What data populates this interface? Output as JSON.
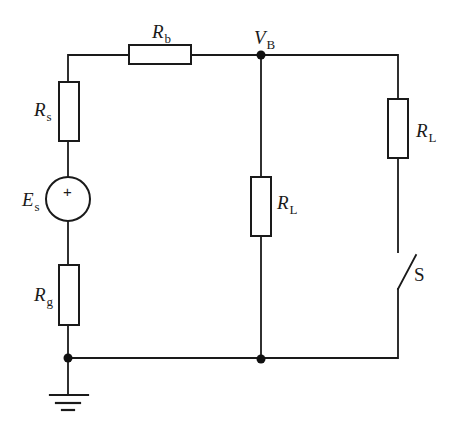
{
  "diagram": {
    "type": "circuit schematic",
    "colors": {
      "line": "#1a1a1a",
      "background": "#ffffff"
    },
    "labels": {
      "Rb": {
        "symbol": "R",
        "subscript": "b"
      },
      "Rs": {
        "symbol": "R",
        "subscript": "s"
      },
      "Es": {
        "symbol": "E",
        "subscript": "s"
      },
      "Rg": {
        "symbol": "R",
        "subscript": "g"
      },
      "VB": {
        "symbol": "V",
        "subscript": "B"
      },
      "RL_middle": {
        "symbol": "R",
        "subscript": "L"
      },
      "RL_right": {
        "symbol": "R",
        "subscript": "L"
      },
      "S": {
        "symbol": "S"
      }
    },
    "source_polarity": "+",
    "components": [
      {
        "id": "Rs",
        "kind": "resistor",
        "branch": "left"
      },
      {
        "id": "Es",
        "kind": "voltage-source",
        "branch": "left"
      },
      {
        "id": "Rg",
        "kind": "resistor",
        "branch": "left"
      },
      {
        "id": "Rb",
        "kind": "resistor",
        "branch": "top"
      },
      {
        "id": "RL_middle",
        "kind": "resistor",
        "branch": "middle"
      },
      {
        "id": "RL_right",
        "kind": "resistor",
        "branch": "right"
      },
      {
        "id": "S",
        "kind": "switch",
        "state": "open",
        "branch": "right"
      },
      {
        "id": "ground",
        "kind": "ground",
        "branch": "bottom-left"
      }
    ],
    "nodes": [
      "VB",
      "ground node"
    ]
  }
}
